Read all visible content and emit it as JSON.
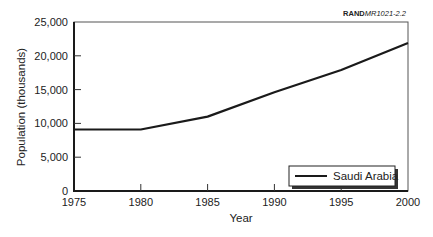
{
  "source_label": {
    "bold": "RAND",
    "italic": "MR1021-2.2"
  },
  "chart_data": {
    "type": "line",
    "title": "",
    "xlabel": "Year",
    "ylabel": "Population (thousands)",
    "x": [
      1975,
      1980,
      1985,
      1990,
      1995,
      2000
    ],
    "series": [
      {
        "name": "Saudi Arabia",
        "values": [
          9100,
          9100,
          11000,
          14600,
          17900,
          21900
        ],
        "color": "#1a1a1a"
      }
    ],
    "xlim": [
      1975,
      2000
    ],
    "ylim": [
      0,
      25000
    ],
    "xticks": [
      1975,
      1980,
      1985,
      1990,
      1995,
      2000
    ],
    "yticks": [
      0,
      5000,
      10000,
      15000,
      20000,
      25000
    ],
    "ytick_labels": [
      "0",
      "5,000",
      "10,000",
      "15,000",
      "20,000",
      "25,000"
    ],
    "grid": false,
    "legend_position": "lower right"
  }
}
